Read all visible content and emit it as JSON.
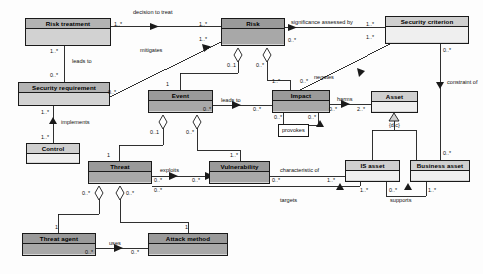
{
  "diagram": {
    "type": "uml-class-diagram",
    "width": 483,
    "height": 274,
    "colors": {
      "background": "#fdfdfd",
      "stroke": "#1a1a1a",
      "fill_light": "#e4e4e4",
      "fill_mid": "#d2d2d2",
      "fill_dark": "#a8a8a8",
      "header_light": "#c9c9c9",
      "header_mid": "#b3b3b3",
      "header_dark": "#9a9a9a"
    }
  },
  "classes": [
    {
      "id": "risk_treatment",
      "name": "Risk treatment",
      "x": 25,
      "y": 18,
      "w": 86,
      "h": 28,
      "shade": "mid"
    },
    {
      "id": "risk",
      "name": "Risk",
      "x": 221,
      "y": 18,
      "w": 64,
      "h": 28,
      "shade": "dark"
    },
    {
      "id": "security_criterion",
      "name": "Security criterion",
      "x": 385,
      "y": 16,
      "w": 84,
      "h": 28,
      "shade": "pale"
    },
    {
      "id": "security_requirement",
      "name": "Security requirement",
      "x": 18,
      "y": 82,
      "w": 92,
      "h": 24,
      "shade": "mid"
    },
    {
      "id": "event",
      "name": "Event",
      "x": 148,
      "y": 90,
      "w": 65,
      "h": 23,
      "shade": "dark"
    },
    {
      "id": "impact",
      "name": "Impact",
      "x": 272,
      "y": 90,
      "w": 58,
      "h": 23,
      "shade": "dark"
    },
    {
      "id": "asset",
      "name": "Asset",
      "x": 371,
      "y": 91,
      "w": 47,
      "h": 22,
      "shade": "pale"
    },
    {
      "id": "control",
      "name": "Control",
      "x": 26,
      "y": 143,
      "w": 54,
      "h": 21,
      "shade": "pale"
    },
    {
      "id": "threat",
      "name": "Threat",
      "x": 88,
      "y": 161,
      "w": 64,
      "h": 23,
      "shade": "dark"
    },
    {
      "id": "vulnerability",
      "name": "Vulnerability",
      "x": 209,
      "y": 161,
      "w": 61,
      "h": 23,
      "shade": "dark"
    },
    {
      "id": "is_asset",
      "name": "IS asset",
      "x": 345,
      "y": 160,
      "w": 55,
      "h": 22,
      "shade": "pale"
    },
    {
      "id": "business_asset",
      "name": "Business asset",
      "x": 410,
      "y": 160,
      "w": 60,
      "h": 22,
      "shade": "pale"
    },
    {
      "id": "threat_agent",
      "name": "Threat agent",
      "x": 22,
      "y": 233,
      "w": 74,
      "h": 23,
      "shade": "dark"
    },
    {
      "id": "attack_method",
      "name": "Attack method",
      "x": 148,
      "y": 233,
      "w": 80,
      "h": 23,
      "shade": "dark"
    }
  ],
  "associations": [
    {
      "id": "decision_to_treat",
      "label": "decision to treat",
      "source": "risk_treatment",
      "target": "risk",
      "source_mult": "1..*",
      "target_mult": "1..*"
    },
    {
      "id": "leads_to_treatment",
      "label": "leads to",
      "source": "risk_treatment",
      "target": "security_requirement",
      "source_mult": "1..*",
      "target_mult": "0..*"
    },
    {
      "id": "mitigates",
      "label": "mitigates",
      "source": "security_requirement",
      "target": "risk",
      "source_mult": "0..*",
      "target_mult": "1..*"
    },
    {
      "id": "implements",
      "label": "implements",
      "source": "control",
      "target": "security_requirement",
      "source_mult": "1..*",
      "target_mult": "1..*"
    },
    {
      "id": "significance",
      "label": "significance assessed by",
      "source": "risk",
      "target": "security_criterion",
      "source_mult": "0..*",
      "target_mult": "1..*"
    },
    {
      "id": "leads_to_event",
      "label": "leads to",
      "source": "event",
      "target": "impact",
      "source_mult": "0..*",
      "target_mult": "0..*"
    },
    {
      "id": "negates",
      "label": "negates",
      "source": "impact",
      "target": "security_criterion",
      "source_mult": "0..*",
      "target_mult": "1..*"
    },
    {
      "id": "harms",
      "label": "harms",
      "source": "impact",
      "target": "asset",
      "source_mult": "0..*",
      "target_mult": "2..*"
    },
    {
      "id": "provokes",
      "label": "provokes",
      "source": "impact",
      "target": "impact",
      "source_mult": "0..*",
      "target_mult": "0..*"
    },
    {
      "id": "constraint_of",
      "label": "constraint of",
      "source": "security_criterion",
      "target": "business_asset",
      "source_mult": "0..*",
      "target_mult": "0..*"
    },
    {
      "id": "exploits",
      "label": "exploits",
      "source": "threat",
      "target": "vulnerability",
      "source_mult": "0..*",
      "target_mult": "0..*"
    },
    {
      "id": "characteristic_of",
      "label": "characteristic of",
      "source": "vulnerability",
      "target": "is_asset",
      "source_mult": "0..*",
      "target_mult": "1..*"
    },
    {
      "id": "targets",
      "label": "targets",
      "source": "threat",
      "target": "is_asset",
      "source_mult": "0..*",
      "target_mult": "1..*"
    },
    {
      "id": "supports",
      "label": "supports",
      "source": "is_asset",
      "target": "business_asset",
      "source_mult": "0..*",
      "target_mult": "1..*"
    },
    {
      "id": "uses",
      "label": "uses",
      "source": "threat_agent",
      "target": "attack_method",
      "source_mult": "0..*",
      "target_mult": "0..*"
    }
  ],
  "aggregations": [
    {
      "id": "risk_event",
      "whole": "risk",
      "part": "event",
      "whole_mult": "0..1",
      "part_mult": "1"
    },
    {
      "id": "risk_impact",
      "whole": "risk",
      "part": "impact",
      "whole_mult": "0..*",
      "part_mult": "1..*"
    },
    {
      "id": "event_threat",
      "whole": "event",
      "part": "threat",
      "whole_mult": "0..1",
      "part_mult": "1"
    },
    {
      "id": "event_vuln",
      "whole": "event",
      "part": "vulnerability",
      "whole_mult": "0..*",
      "part_mult": "1..*"
    },
    {
      "id": "threat_agent_agg",
      "whole": "threat",
      "part": "threat_agent",
      "whole_mult": "0..*",
      "part_mult": "1"
    },
    {
      "id": "threat_method_agg",
      "whole": "threat",
      "part": "attack_method",
      "whole_mult": "0..*",
      "part_mult": "1"
    }
  ],
  "generalizations": [
    {
      "id": "asset_gen",
      "parent": "asset",
      "children": [
        "is_asset",
        "business_asset"
      ],
      "constraint": "{d,c}"
    }
  ],
  "labels": {
    "decision_to_treat": "decision to treat",
    "leads_to_a": "leads to",
    "leads_to_b": "leads to",
    "mitigates": "mitigates",
    "implements": "implements",
    "significance_assessed_by": "significance assessed by",
    "negates": "negates",
    "harms": "harms",
    "provokes": "provokes",
    "constraint_of": "constraint of",
    "exploits": "exploits",
    "characteristic_of": "characteristic of",
    "targets": "targets",
    "supports": "supports",
    "uses": "uses",
    "dc_constraint": "{d,c}"
  },
  "multiplicities": {
    "rt_right": "1..*",
    "risk_left_top": "1..*",
    "risk_mit": "1..*",
    "rt_down": "1..*",
    "sr_up": "0..*",
    "sr_right": "0..*",
    "sr_down": "1..*",
    "control_up": "1..*",
    "risk_sig_right": "0..*",
    "sc_left": "1..*",
    "sc_neg": "1..*",
    "risk_event_end": "0..1",
    "risk_impact_end": "0..*",
    "event_top": "1",
    "impact_top": "1..*",
    "event_right": "0..*",
    "impact_left": "0..*",
    "impact_neg": "0..*",
    "impact_harms": "0..*",
    "asset_left": "2..*",
    "impact_prov_a": "0..*",
    "impact_prov_b": "0..*",
    "event_thr_end": "0..1",
    "event_vul_end": "0..*",
    "threat_top": "1",
    "vuln_top": "1..*",
    "threat_right": "0..*",
    "vuln_left": "0..*",
    "vuln_right": "0..*",
    "is_asset_left": "1..*",
    "threat_tgt": "0..*",
    "is_tgt": "1..*",
    "is_sup": "0..*",
    "ba_sup": "1..*",
    "sc_constr": "0..*",
    "ba_constr": "0..*",
    "threat_agg_a": "0..*",
    "threat_agg_b": "0..*",
    "agent_top": "1",
    "method_top": "1",
    "agent_right": "0..*",
    "method_left": "0..*"
  }
}
